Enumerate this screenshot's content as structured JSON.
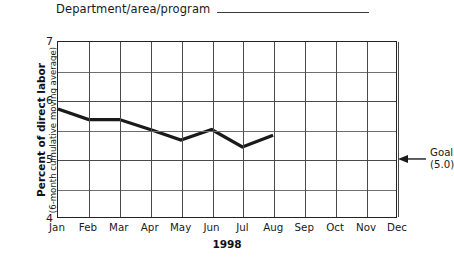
{
  "header": {
    "label": "Department/area/program",
    "blank_line": ""
  },
  "chart_data": {
    "type": "line",
    "title": "",
    "xlabel": "1998",
    "ylabel": "Percent of direct labor",
    "ylabel_sub": "(6-month cumulative moving average)",
    "categories": [
      "Jan",
      "Feb",
      "Mar",
      "Apr",
      "May",
      "Jun",
      "Jul",
      "Aug",
      "Sep",
      "Oct",
      "Nov",
      "Dec"
    ],
    "values": [
      5.85,
      5.67,
      5.67,
      5.5,
      5.32,
      5.5,
      5.2,
      5.4,
      null,
      null,
      null,
      null
    ],
    "series": [
      {
        "name": "Percent of direct labor",
        "values": [
          5.85,
          5.67,
          5.67,
          5.5,
          5.32,
          5.5,
          5.2,
          5.4,
          null,
          null,
          null,
          null
        ]
      }
    ],
    "ylim": [
      4,
      7
    ],
    "yticks": [
      4,
      5,
      6,
      7
    ],
    "ytick_labels": [
      "4",
      "5",
      "6",
      "7"
    ],
    "y_minor_ticks": [
      4.5,
      5.5,
      6.5
    ],
    "grid": true,
    "legend": "none",
    "line_color": "#1a1a1a",
    "annotations": [
      {
        "name": "goal",
        "label": "Goal",
        "value_label": "(5.0)",
        "value": 5.0,
        "arrow": "left-arrow-icon"
      }
    ]
  },
  "colors": {
    "line": "#1a1a1a",
    "grid": "#4a4a4a",
    "frame": "#232323",
    "background": "#ffffff"
  }
}
